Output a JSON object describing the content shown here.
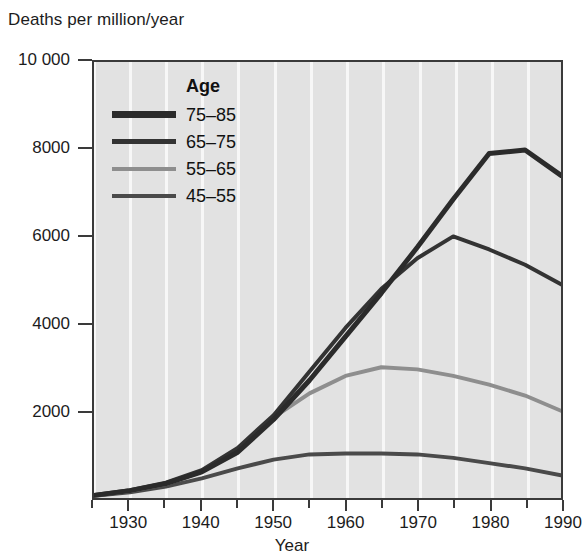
{
  "chart_data": {
    "type": "line",
    "title": "Deaths per million/year",
    "ylabel": "Deaths per million/year",
    "xlabel": "Year",
    "xlim": [
      1925,
      1990
    ],
    "ylim": [
      0,
      10000
    ],
    "grid": "vertical white gridlines every 5 years",
    "legend_position": "upper-left inside plot",
    "legend_title": "Age",
    "y_ticks": [
      {
        "value": 10000,
        "label": "10 000"
      },
      {
        "value": 8000,
        "label": "8000"
      },
      {
        "value": 6000,
        "label": "6000"
      },
      {
        "value": 4000,
        "label": "4000"
      },
      {
        "value": 2000,
        "label": "2000"
      }
    ],
    "x_ticks": [
      {
        "value": 1930,
        "label": "1930"
      },
      {
        "value": 1940,
        "label": "1940"
      },
      {
        "value": 1950,
        "label": "1950"
      },
      {
        "value": 1960,
        "label": "1960"
      },
      {
        "value": 1970,
        "label": "1970"
      },
      {
        "value": 1980,
        "label": "1980"
      },
      {
        "value": 1990,
        "label": "1990"
      }
    ],
    "x_minor_ticks": [
      1925,
      1935,
      1945,
      1955,
      1965,
      1975,
      1985
    ],
    "x": [
      1925,
      1930,
      1935,
      1940,
      1945,
      1950,
      1955,
      1960,
      1965,
      1970,
      1975,
      1980,
      1985,
      1990
    ],
    "series": [
      {
        "name": "75–85",
        "color": "#2b2b2b",
        "width": 5,
        "values": [
          60,
          170,
          330,
          600,
          1050,
          1800,
          2700,
          3700,
          4700,
          5750,
          6850,
          7900,
          7980,
          7400
        ]
      },
      {
        "name": "65–75",
        "color": "#333333",
        "width": 4,
        "values": [
          70,
          180,
          350,
          640,
          1150,
          1900,
          2900,
          3900,
          4800,
          5500,
          6000,
          5700,
          5350,
          4900
        ]
      },
      {
        "name": "55–65",
        "color": "#8e8e8e",
        "width": 4,
        "values": [
          60,
          160,
          320,
          600,
          1100,
          1850,
          2400,
          2800,
          3000,
          2950,
          2800,
          2600,
          2350,
          2000
        ]
      },
      {
        "name": "45–55",
        "color": "#4a4a4a",
        "width": 4,
        "values": [
          50,
          130,
          260,
          450,
          680,
          880,
          1000,
          1020,
          1020,
          1000,
          920,
          800,
          680,
          520
        ]
      }
    ]
  },
  "legend": {
    "title": "Age",
    "entries": [
      {
        "label": "75–85",
        "color": "#2b2b2b",
        "thickness": 7
      },
      {
        "label": "65–75",
        "color": "#333333",
        "thickness": 5
      },
      {
        "label": "55–65",
        "color": "#8e8e8e",
        "thickness": 4
      },
      {
        "label": "45–55",
        "color": "#4a4a4a",
        "thickness": 4
      }
    ]
  }
}
